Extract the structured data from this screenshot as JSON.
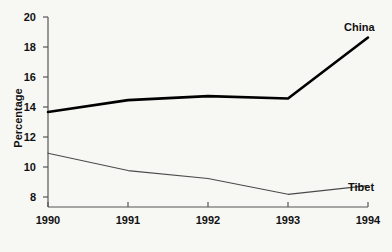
{
  "chart_data": {
    "type": "line",
    "title": "",
    "xlabel": "",
    "ylabel": "Percentage",
    "x": [
      1990,
      1991,
      1992,
      1993,
      1994
    ],
    "xtick_labels": [
      "1990",
      "1991",
      "1992",
      "1993",
      "1994"
    ],
    "ytick_labels": [
      "8",
      "10",
      "12",
      "14",
      "16",
      "18",
      "20"
    ],
    "yticks": [
      8,
      10,
      12,
      14,
      16,
      18,
      20
    ],
    "xlim": [
      1990,
      1994
    ],
    "ylim": [
      8,
      20
    ],
    "grid": false,
    "legend_position": "inline-right",
    "series": [
      {
        "name": "China",
        "values": [
          14.0,
          14.75,
          15.0,
          14.85,
          18.7
        ],
        "color": "#000000",
        "line_width": 2.6
      },
      {
        "name": "Tibet",
        "values": [
          11.4,
          10.3,
          9.8,
          8.8,
          9.35
        ],
        "color": "#4a4a4a",
        "line_width": 1.1
      }
    ],
    "annotations": [
      {
        "text": "China",
        "series": "China"
      },
      {
        "text": "Tibet",
        "series": "Tibet"
      }
    ],
    "axis_color": "#555555",
    "background_color": "#f7f7f4"
  }
}
